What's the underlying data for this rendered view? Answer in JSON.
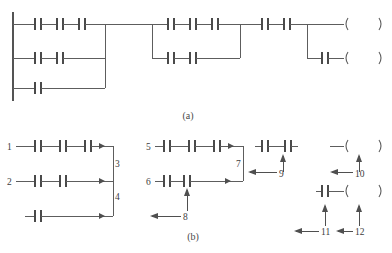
{
  "figure": {
    "title_sliver": "‥‥‥ ‥‥ ‥‥‥",
    "captions": {
      "a": "(a)",
      "b": "(b)"
    },
    "labels": {
      "n1": "1",
      "n2": "2",
      "n3": "3",
      "n4": "4",
      "n5": "5",
      "n6": "6",
      "n7": "7",
      "n8": "8",
      "n9": "9",
      "n10": "10",
      "n11": "11",
      "n12": "12"
    },
    "colors": {
      "wire": "#5d5d5d",
      "rail": "#545454",
      "contact": "#4a4a4a",
      "text": "#3d3d3d",
      "background": "#ffffff"
    },
    "diagram_a": {
      "type": "ladder-logic",
      "power_rail": {
        "x": 13,
        "y_top": 12,
        "y_bottom": 101
      },
      "branches": [
        {
          "name": "group-1-row-1",
          "y": 24,
          "contacts": 3
        },
        {
          "name": "group-1-row-2",
          "y": 58,
          "contacts": 2
        },
        {
          "name": "group-1-row-3",
          "y": 88,
          "contacts": 1
        },
        {
          "name": "group-2-row-1",
          "y": 24,
          "contacts": 3
        },
        {
          "name": "group-2-row-2",
          "y": 58,
          "contacts": 2
        },
        {
          "name": "group-3-row-1",
          "y": 24,
          "contacts": 2
        },
        {
          "name": "group-3-row-2",
          "y": 58,
          "contacts": 1
        }
      ],
      "coils": [
        {
          "name": "coil-top",
          "y": 24
        },
        {
          "name": "coil-bottom",
          "y": 58
        }
      ]
    },
    "diagram_b": {
      "type": "ladder-logic-annotated",
      "groups": [
        {
          "name": "group-1",
          "rows": [
            {
              "label": "1",
              "y": 146,
              "contacts": 3
            },
            {
              "label": "2",
              "y": 181,
              "contacts": 2
            },
            {
              "label": "",
              "y": 216,
              "contacts": 1
            }
          ],
          "link_labels": [
            "3",
            "4"
          ]
        },
        {
          "name": "group-2",
          "rows": [
            {
              "label": "5",
              "y": 146,
              "contacts": 3
            },
            {
              "label": "6",
              "y": 181,
              "contacts": 2
            }
          ],
          "link_labels": [
            "7",
            "8"
          ]
        },
        {
          "name": "group-3",
          "rows": [
            {
              "label": "",
              "y": 146,
              "contacts": 2
            },
            {
              "label": "",
              "y": 191,
              "contacts": 1
            }
          ],
          "link_labels": [
            "9",
            "10",
            "11",
            "12"
          ]
        }
      ]
    }
  }
}
